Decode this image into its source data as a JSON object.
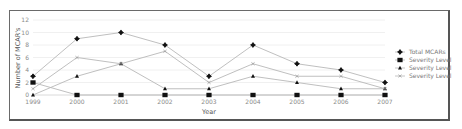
{
  "chart_data": {
    "type": "line",
    "title": "",
    "xlabel": "Year",
    "ylabel": "Number of MCAR's",
    "ylim": [
      0,
      12
    ],
    "yticks": [
      0,
      2,
      4,
      6,
      8,
      10,
      12
    ],
    "grid": true,
    "legend_position": "right",
    "categories": [
      "1999",
      "2000",
      "2001",
      "2002",
      "2003",
      "2004",
      "2005",
      "2006",
      "2007"
    ],
    "series": [
      {
        "name": "Total MCARs",
        "marker": "diamond-cross",
        "values": [
          3,
          9,
          10,
          8,
          3,
          8,
          5,
          4,
          2
        ]
      },
      {
        "name": "Severity Level",
        "marker": "square",
        "values": [
          2,
          0,
          0,
          0,
          0,
          0,
          0,
          0,
          0
        ]
      },
      {
        "name": "Severity Level",
        "marker": "triangle",
        "values": [
          0,
          3,
          5,
          1,
          1,
          3,
          2,
          1,
          1
        ]
      },
      {
        "name": "Severity Level",
        "marker": "x",
        "values": [
          1,
          6,
          5,
          7,
          2,
          5,
          3,
          3,
          1
        ]
      }
    ]
  },
  "colors": {
    "line": "#b8b8b8",
    "marker": "#111111",
    "grid": "#ececec",
    "frame": "#666666"
  }
}
